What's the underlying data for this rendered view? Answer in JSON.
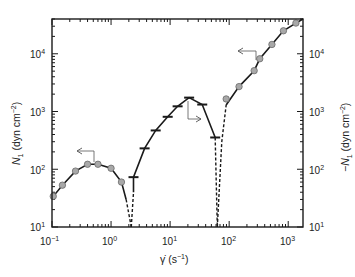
{
  "chart_data": {
    "type": "scatter",
    "title": "",
    "xlabel": "γ̇ (s⁻¹)",
    "ylabel": "N₁ (dyn cm⁻²)",
    "ylabel_right": "−N₁ (dyn cm⁻²)",
    "xscale": "log",
    "yscale": "log",
    "xlim": [
      0.1,
      1780
    ],
    "ylim": [
      10,
      40000
    ],
    "grid": false,
    "x_ticks": [
      "10⁻¹",
      "10⁰",
      "10¹",
      "10²",
      "10³"
    ],
    "y_ticks": [
      "10¹",
      "10²",
      "10³",
      "10⁴"
    ],
    "y_ticks_right": [
      "10¹",
      "10²",
      "10³",
      "10⁴"
    ],
    "series": [
      {
        "name": "N1 positive (low rate)",
        "marker": "circle",
        "axis": "left",
        "x": [
          0.105,
          0.15,
          0.25,
          0.4,
          0.6,
          1.0,
          1.5
        ],
        "y": [
          34,
          53,
          93,
          122,
          122,
          104,
          60
        ]
      },
      {
        "name": "-N1 negative (intermediate rate)",
        "marker": "dash",
        "axis": "right",
        "x": [
          2.4,
          3.7,
          5.7,
          9.1,
          13.4,
          21,
          35,
          58
        ],
        "y": [
          73,
          230,
          470,
          810,
          1230,
          1740,
          1320,
          355
        ]
      },
      {
        "name": "N1 positive (high rate)",
        "marker": "circle",
        "axis": "left",
        "x": [
          89,
          147,
          265,
          330,
          530,
          830,
          1350
        ],
        "y": [
          1650,
          2700,
          5100,
          8200,
          14500,
          25000,
          34000
        ]
      }
    ],
    "sign_changes_x": [
      2.2,
      63
    ],
    "annotations": [
      {
        "type": "arrow",
        "direction": "left",
        "meaning": "low-rate points read on left axis (N1)"
      },
      {
        "type": "arrow",
        "direction": "right",
        "meaning": "mid-rate points read on right axis (-N1)"
      },
      {
        "type": "arrow",
        "direction": "left",
        "meaning": "high-rate points read on left axis (N1)"
      }
    ]
  },
  "labels": {
    "x_axis": "γ̇ (s",
    "x_axis_sup": "−1",
    "x_axis_end": ")",
    "y_left_n": "N",
    "y_left_sub": "1",
    "y_left_rest": " (dyn cm",
    "y_left_sup": "−2",
    "y_left_end": ")",
    "y_right_prefix": "−N",
    "y_right_sub": "1",
    "y_right_rest": " (dyn cm",
    "y_right_sup": "−2",
    "y_right_end": ")",
    "xt": [
      {
        "base": "10",
        "exp": "−1"
      },
      {
        "base": "10",
        "exp": "0"
      },
      {
        "base": "10",
        "exp": "1"
      },
      {
        "base": "10",
        "exp": "2"
      },
      {
        "base": "10",
        "exp": "3"
      }
    ],
    "yt": [
      {
        "base": "10",
        "exp": "1"
      },
      {
        "base": "10",
        "exp": "2"
      },
      {
        "base": "10",
        "exp": "3"
      },
      {
        "base": "10",
        "exp": "4"
      }
    ]
  },
  "colors": {
    "marker_fill": "#a8a8a8",
    "marker_stroke": "#6a6a6a",
    "line": "#1a1a1a",
    "axis": "#1a1a1a",
    "arrow": "#555555"
  }
}
